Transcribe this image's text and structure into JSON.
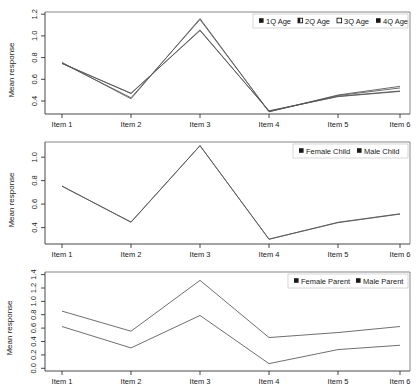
{
  "figure": {
    "width": 417,
    "height": 390,
    "background": "#ffffff",
    "line_color": "#555555",
    "axis_color": "#333333"
  },
  "chart_data": [
    {
      "type": "line",
      "panel_index": 1,
      "panel_name": "age-quartiles",
      "title": "",
      "xlabel": "",
      "ylabel": "Mean response",
      "categories": [
        "Item 1",
        "Item 2",
        "Item 3",
        "Item 4",
        "Item 5",
        "Item 6"
      ],
      "xticklabels": [
        "Item 1",
        "Item 2",
        "Item 3",
        "Item 4",
        "Item 5",
        "Item 6"
      ],
      "yticks": [
        0.4,
        0.6,
        0.8,
        1.0,
        1.2
      ],
      "yticklabels": [
        "0.4",
        "0.6",
        "0.8",
        "1.0",
        "1.2"
      ],
      "ylim": [
        0.28,
        1.22
      ],
      "grid": false,
      "legend_position": "top-right",
      "series": [
        {
          "name": "1Q Age",
          "marker": "filled-square",
          "values": [
            0.755,
            0.42,
            1.16,
            0.3,
            0.455,
            0.535
          ]
        },
        {
          "name": "2Q Age",
          "marker": "half-square",
          "values": [
            0.75,
            0.43,
            1.15,
            0.302,
            0.45,
            0.52
          ]
        },
        {
          "name": "3Q Age",
          "marker": "open-square",
          "values": [
            0.748,
            0.468,
            1.055,
            0.306,
            0.443,
            0.492
          ]
        },
        {
          "name": "4Q Age",
          "marker": "filled-square",
          "values": [
            0.745,
            0.472,
            1.048,
            0.31,
            0.44,
            0.488
          ]
        }
      ]
    },
    {
      "type": "line",
      "panel_index": 2,
      "panel_name": "child-gender",
      "title": "",
      "xlabel": "",
      "ylabel": "Mean response",
      "categories": [
        "Item 1",
        "Item 2",
        "Item 3",
        "Item 4",
        "Item 5",
        "Item 6"
      ],
      "xticklabels": [
        "Item 1",
        "Item 2",
        "Item 3",
        "Item 4",
        "Item 5",
        "Item 6"
      ],
      "yticks": [
        0.4,
        0.6,
        0.8,
        1.0
      ],
      "yticklabels": [
        "0.4",
        "0.6",
        "0.8",
        "1.0"
      ],
      "ylim": [
        0.26,
        1.13
      ],
      "grid": false,
      "legend_position": "top-right",
      "series": [
        {
          "name": "Female Child",
          "marker": "filled-square",
          "values": [
            0.755,
            0.445,
            1.1,
            0.3,
            0.445,
            0.518
          ]
        },
        {
          "name": "Male Child",
          "marker": "filled-square",
          "values": [
            0.752,
            0.448,
            1.098,
            0.302,
            0.442,
            0.515
          ]
        }
      ]
    },
    {
      "type": "line",
      "panel_index": 3,
      "panel_name": "parent-gender",
      "title": "",
      "xlabel": "",
      "ylabel": "Mean response",
      "categories": [
        "Item 1",
        "Item 2",
        "Item 3",
        "Item 4",
        "Item 5",
        "Item 6"
      ],
      "xticklabels": [
        "Item 1",
        "Item 2",
        "Item 3",
        "Item 4",
        "Item 5",
        "Item 6"
      ],
      "yticks": [
        0.0,
        0.2,
        0.4,
        0.6,
        0.8,
        1.0,
        1.2,
        1.4
      ],
      "yticklabels": [
        "0.0",
        "0.2",
        "0.4",
        "0.6",
        "0.8",
        "1.0",
        "1.2",
        "1.4"
      ],
      "ylim": [
        -0.04,
        1.44
      ],
      "grid": false,
      "legend_position": "top-right",
      "series": [
        {
          "name": "Female Parent",
          "marker": "filled-square",
          "values": [
            0.855,
            0.555,
            1.315,
            0.46,
            0.535,
            0.625
          ]
        },
        {
          "name": "Male Parent",
          "marker": "filled-square",
          "values": [
            0.625,
            0.305,
            0.79,
            0.07,
            0.28,
            0.345
          ]
        }
      ]
    }
  ]
}
